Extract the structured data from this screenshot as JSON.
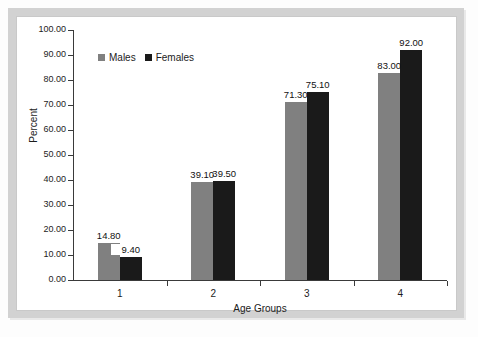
{
  "chart_data": {
    "type": "bar",
    "title": "",
    "subtitle": "",
    "xlabel": "Age Groups",
    "ylabel": "Percent",
    "categories": [
      "1",
      "2",
      "3",
      "4"
    ],
    "series": [
      {
        "name": "Males",
        "color": "#808080",
        "values": [
          14.8,
          39.1,
          71.3,
          83.0
        ]
      },
      {
        "name": "Females",
        "color": "#1a1a1a",
        "values": [
          9.4,
          39.5,
          75.1,
          92.0
        ]
      }
    ],
    "value_labels": {
      "Males": [
        "14.80",
        "39.10",
        "71.30",
        "83.00"
      ],
      "Females": [
        "9.40",
        "39.50",
        "75.10",
        "92.00"
      ]
    },
    "ylim": [
      0,
      100
    ],
    "ytick_step": 10,
    "ytick_labels": [
      "100.00",
      "90.00",
      "80.00",
      "70.00",
      "60.00",
      "50.00",
      "40.00",
      "30.00",
      "20.00",
      "10.00",
      "0.00"
    ],
    "grid": false,
    "legend_position": "top-left-inside",
    "bar_grouping": "clustered-adjacent",
    "data_labels_shown": true
  },
  "legend": {
    "items": [
      {
        "label": "Males",
        "color": "#808080"
      },
      {
        "label": "Females",
        "color": "#1a1a1a"
      }
    ]
  },
  "axes": {
    "y": {
      "label": "Percent",
      "ticks": [
        "100.00",
        "90.00",
        "80.00",
        "70.00",
        "60.00",
        "50.00",
        "40.00",
        "30.00",
        "20.00",
        "10.00",
        "0.00"
      ]
    },
    "x": {
      "label": "Age Groups",
      "ticks": [
        "1",
        "2",
        "3",
        "4"
      ]
    }
  },
  "colors": {
    "males_bar": "#808080",
    "females_bar": "#1a1a1a",
    "axis": "#3a3a3a",
    "panel_background": "#ffffff",
    "frame": "#d2d2d2",
    "text": "#1c1c1c"
  }
}
